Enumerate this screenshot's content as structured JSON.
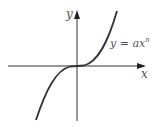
{
  "diagram": {
    "type": "function-graph",
    "curve_label": "y = ax",
    "curve_exponent": "n",
    "x_axis_label": "x",
    "y_axis_label": "y",
    "colors": {
      "axis": "#333333",
      "curve": "#333333",
      "label": "#555555"
    }
  }
}
